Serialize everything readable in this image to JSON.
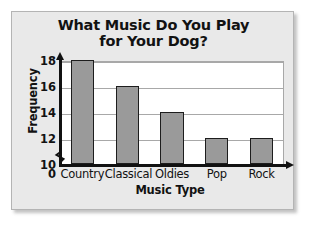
{
  "chart_data": {
    "type": "bar",
    "title": "What Music Do You Play for Your Dog?",
    "title_lines": [
      "What Music Do You Play",
      "for Your Dog?"
    ],
    "xlabel": "Music Type",
    "ylabel": "Frequency",
    "categories": [
      "Country",
      "Classical",
      "Oldies",
      "Pop",
      "Rock"
    ],
    "values": [
      18,
      16,
      14,
      12,
      12
    ],
    "ylim": [
      10,
      18
    ],
    "yticks": [
      "0",
      "10",
      "12",
      "14",
      "16",
      "18"
    ],
    "ytick_values": [
      0,
      10,
      12,
      14,
      16,
      18
    ],
    "axis_break": true,
    "axis_break_note": "zigzag break on y-axis between 0 and 10",
    "grid": true,
    "legend": "none",
    "colors": {
      "bar_fill": "#9a9a9a",
      "bar_edge": "#1d1d1d",
      "panel_background": "#e9e9e9",
      "plot_background": "#ffffff",
      "gridline": "#a8a8a8",
      "text": "#121212"
    }
  }
}
